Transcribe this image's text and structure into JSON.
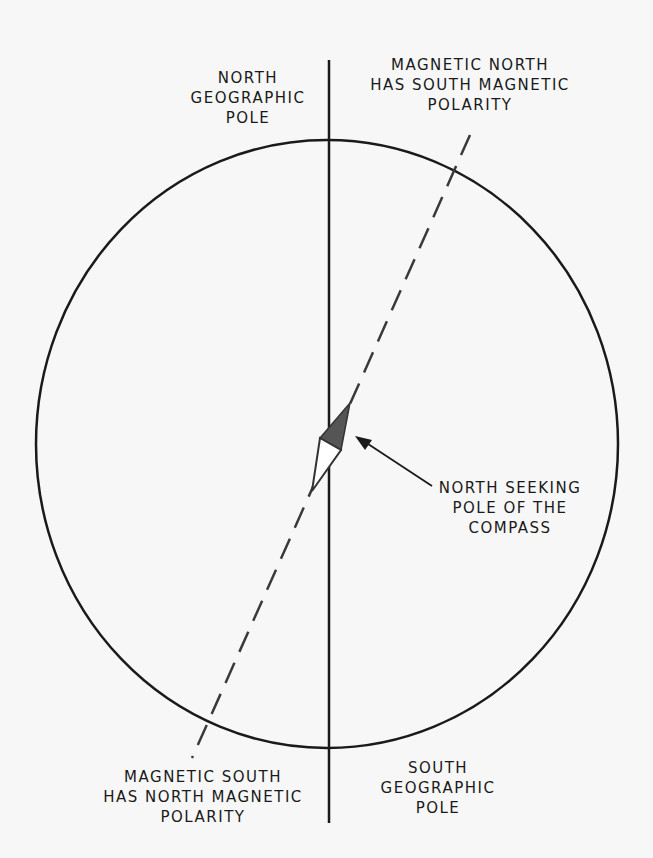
{
  "labels": {
    "north_geographic_pole": [
      "NORTH",
      "GEOGRAPHIC",
      "POLE"
    ],
    "magnetic_north": [
      "MAGNETIC NORTH",
      "HAS SOUTH MAGNETIC",
      "POLARITY"
    ],
    "north_seeking_pole": [
      "NORTH SEEKING",
      "POLE OF THE",
      "COMPASS"
    ],
    "magnetic_south": [
      "MAGNETIC SOUTH",
      "HAS NORTH MAGNETIC",
      "POLARITY"
    ],
    "south_geographic_pole": [
      "SOUTH",
      "GEOGRAPHIC",
      "POLE"
    ]
  },
  "colors": {
    "line": "#1a1a1a",
    "dashed": "#3a3a3a",
    "needle_fill": "#555555",
    "background": "#f7f7f7"
  }
}
